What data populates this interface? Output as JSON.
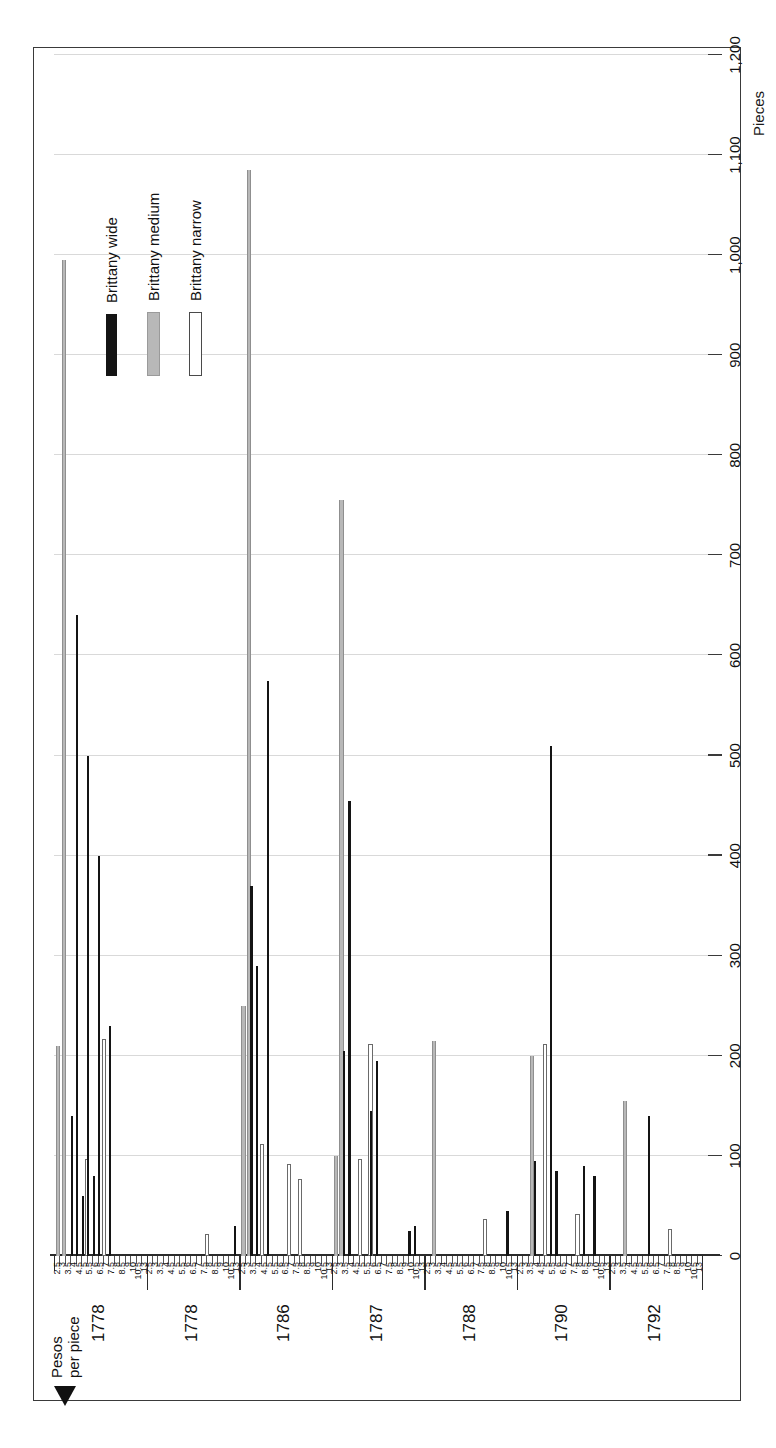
{
  "figure": {
    "border_color": "#3a3a3a",
    "background": "#ffffff",
    "orientation": "rotated-90"
  },
  "axes": {
    "value_axis_title": "Pieces",
    "category_axis_title_line1": "Pesos",
    "category_axis_title_line2": "per piece",
    "value_ticks": [
      "1,200",
      "1,100",
      "1,000",
      "900",
      "800",
      "700",
      "600",
      "500",
      "400",
      "300",
      "200",
      "100",
      "0"
    ],
    "value_min": 0,
    "value_max": 1200,
    "grid": true
  },
  "legend": {
    "position": "top-left",
    "items": [
      {
        "label": "Brittany wide",
        "swatch": "wide",
        "color": "#141414"
      },
      {
        "label": "Brittany medium",
        "swatch": "medium",
        "color": "#b8b8b8"
      },
      {
        "label": "Brittany narrow",
        "swatch": "narrow",
        "color": "#ffffff"
      }
    ]
  },
  "chart_data": {
    "type": "bar",
    "title": "",
    "xlabel": "Pesos per piece",
    "ylabel": "Pieces",
    "ylim": [
      0,
      1200
    ],
    "grid": true,
    "orientation": "vertical-bars-rotated",
    "groups": [
      "1778",
      "1778",
      "1786",
      "1787",
      "1788",
      "1790",
      "1792"
    ],
    "price_ticks": [
      "2.5",
      "3",
      "3.5",
      "4",
      "4.5",
      "5",
      "5.5",
      "6",
      "6.5",
      "7",
      "7.5",
      "8",
      "8.5",
      "9",
      "10",
      "10.5",
      "13"
    ],
    "series": [
      {
        "name": "Brittany wide",
        "color": "#141414"
      },
      {
        "name": "Brittany medium",
        "color": "#b8b8b8"
      },
      {
        "name": "Brittany narrow",
        "color": "#ffffff"
      }
    ],
    "data": [
      {
        "group": "1778",
        "price": "2.5",
        "wide": 0,
        "medium": 210,
        "narrow": 0
      },
      {
        "group": "1778",
        "price": "3",
        "wide": 0,
        "medium": 995,
        "narrow": 0
      },
      {
        "group": "1778",
        "price": "3.5",
        "wide": 0,
        "medium": 0,
        "narrow": 0
      },
      {
        "group": "1778",
        "price": "4",
        "wide": 140,
        "medium": 0,
        "narrow": 0
      },
      {
        "group": "1778",
        "price": "4.5",
        "wide": 640,
        "medium": 0,
        "narrow": 0
      },
      {
        "group": "1778",
        "price": "5",
        "wide": 60,
        "medium": 0,
        "narrow": 95
      },
      {
        "group": "1778",
        "price": "5.5",
        "wide": 500,
        "medium": 0,
        "narrow": 0
      },
      {
        "group": "1778",
        "price": "6",
        "wide": 80,
        "medium": 0,
        "narrow": 0
      },
      {
        "group": "1778",
        "price": "6.5",
        "wide": 400,
        "medium": 0,
        "narrow": 215
      },
      {
        "group": "1778",
        "price": "7",
        "wide": 0,
        "medium": 0,
        "narrow": 0
      },
      {
        "group": "1778",
        "price": "7.5",
        "wide": 230,
        "medium": 0,
        "narrow": 0
      },
      {
        "group": "1778",
        "price": "8",
        "wide": 0,
        "medium": 0,
        "narrow": 0
      },
      {
        "group": "1778",
        "price": "8.5",
        "wide": 0,
        "medium": 0,
        "narrow": 0
      },
      {
        "group": "1778",
        "price": "9",
        "wide": 0,
        "medium": 0,
        "narrow": 0
      },
      {
        "group": "1778",
        "price": "10",
        "wide": 0,
        "medium": 0,
        "narrow": 0
      },
      {
        "group": "1778",
        "price": "10.5",
        "wide": 0,
        "medium": 0,
        "narrow": 0
      },
      {
        "group": "1778",
        "price": "13",
        "wide": 0,
        "medium": 0,
        "narrow": 0
      },
      {
        "group": "1778b",
        "price": "2.5",
        "wide": 0,
        "medium": 0,
        "narrow": 0
      },
      {
        "group": "1778b",
        "price": "3",
        "wide": 0,
        "medium": 0,
        "narrow": 0
      },
      {
        "group": "1778b",
        "price": "3.5",
        "wide": 0,
        "medium": 0,
        "narrow": 0
      },
      {
        "group": "1778b",
        "price": "4",
        "wide": 0,
        "medium": 0,
        "narrow": 0
      },
      {
        "group": "1778b",
        "price": "4.5",
        "wide": 0,
        "medium": 0,
        "narrow": 0
      },
      {
        "group": "1778b",
        "price": "5",
        "wide": 0,
        "medium": 0,
        "narrow": 0
      },
      {
        "group": "1778b",
        "price": "5.5",
        "wide": 0,
        "medium": 0,
        "narrow": 0
      },
      {
        "group": "1778b",
        "price": "6",
        "wide": 0,
        "medium": 0,
        "narrow": 0
      },
      {
        "group": "1778b",
        "price": "6.5",
        "wide": 0,
        "medium": 0,
        "narrow": 0
      },
      {
        "group": "1778b",
        "price": "7",
        "wide": 0,
        "medium": 0,
        "narrow": 0
      },
      {
        "group": "1778b",
        "price": "7.5",
        "wide": 0,
        "medium": 0,
        "narrow": 20
      },
      {
        "group": "1778b",
        "price": "8",
        "wide": 0,
        "medium": 0,
        "narrow": 0
      },
      {
        "group": "1778b",
        "price": "8.5",
        "wide": 0,
        "medium": 0,
        "narrow": 0
      },
      {
        "group": "1778b",
        "price": "9",
        "wide": 0,
        "medium": 0,
        "narrow": 0
      },
      {
        "group": "1778b",
        "price": "10",
        "wide": 0,
        "medium": 0,
        "narrow": 0
      },
      {
        "group": "1778b",
        "price": "10.5",
        "wide": 0,
        "medium": 0,
        "narrow": 0
      },
      {
        "group": "1778b",
        "price": "13",
        "wide": 30,
        "medium": 0,
        "narrow": 0
      },
      {
        "group": "1786",
        "price": "2.5",
        "wide": 0,
        "medium": 250,
        "narrow": 0
      },
      {
        "group": "1786",
        "price": "3",
        "wide": 0,
        "medium": 1085,
        "narrow": 0
      },
      {
        "group": "1786",
        "price": "3.5",
        "wide": 370,
        "medium": 0,
        "narrow": 0
      },
      {
        "group": "1786",
        "price": "4",
        "wide": 290,
        "medium": 0,
        "narrow": 110
      },
      {
        "group": "1786",
        "price": "4.5",
        "wide": 0,
        "medium": 0,
        "narrow": 0
      },
      {
        "group": "1786",
        "price": "5",
        "wide": 575,
        "medium": 0,
        "narrow": 0
      },
      {
        "group": "1786",
        "price": "5.5",
        "wide": 0,
        "medium": 0,
        "narrow": 0
      },
      {
        "group": "1786",
        "price": "6",
        "wide": 0,
        "medium": 0,
        "narrow": 0
      },
      {
        "group": "1786",
        "price": "6.5",
        "wide": 0,
        "medium": 0,
        "narrow": 90
      },
      {
        "group": "1786",
        "price": "7",
        "wide": 0,
        "medium": 0,
        "narrow": 0
      },
      {
        "group": "1786",
        "price": "7.5",
        "wide": 0,
        "medium": 0,
        "narrow": 75
      },
      {
        "group": "1786",
        "price": "8",
        "wide": 0,
        "medium": 0,
        "narrow": 0
      },
      {
        "group": "1786",
        "price": "8.5",
        "wide": 0,
        "medium": 0,
        "narrow": 0
      },
      {
        "group": "1786",
        "price": "9",
        "wide": 0,
        "medium": 0,
        "narrow": 0
      },
      {
        "group": "1786",
        "price": "10",
        "wide": 0,
        "medium": 0,
        "narrow": 0
      },
      {
        "group": "1786",
        "price": "10.5",
        "wide": 0,
        "medium": 0,
        "narrow": 0
      },
      {
        "group": "1786",
        "price": "13",
        "wide": 0,
        "medium": 0,
        "narrow": 0
      },
      {
        "group": "1787",
        "price": "2.5",
        "wide": 0,
        "medium": 100,
        "narrow": 0
      },
      {
        "group": "1787",
        "price": "3",
        "wide": 0,
        "medium": 755,
        "narrow": 0
      },
      {
        "group": "1787",
        "price": "3.5",
        "wide": 205,
        "medium": 0,
        "narrow": 0
      },
      {
        "group": "1787",
        "price": "4",
        "wide": 455,
        "medium": 0,
        "narrow": 0
      },
      {
        "group": "1787",
        "price": "4.5",
        "wide": 0,
        "medium": 0,
        "narrow": 95
      },
      {
        "group": "1787",
        "price": "5",
        "wide": 0,
        "medium": 0,
        "narrow": 0
      },
      {
        "group": "1787",
        "price": "5.5",
        "wide": 0,
        "medium": 0,
        "narrow": 210
      },
      {
        "group": "1787",
        "price": "6",
        "wide": 145,
        "medium": 0,
        "narrow": 0
      },
      {
        "group": "1787",
        "price": "6.5",
        "wide": 195,
        "medium": 0,
        "narrow": 0
      },
      {
        "group": "1787",
        "price": "7",
        "wide": 0,
        "medium": 0,
        "narrow": 0
      },
      {
        "group": "1787",
        "price": "7.5",
        "wide": 0,
        "medium": 0,
        "narrow": 0
      },
      {
        "group": "1787",
        "price": "8",
        "wide": 0,
        "medium": 0,
        "narrow": 0
      },
      {
        "group": "1787",
        "price": "8.5",
        "wide": 0,
        "medium": 0,
        "narrow": 0
      },
      {
        "group": "1787",
        "price": "9",
        "wide": 0,
        "medium": 0,
        "narrow": 0
      },
      {
        "group": "1787",
        "price": "10",
        "wide": 25,
        "medium": 0,
        "narrow": 0
      },
      {
        "group": "1787",
        "price": "10.5",
        "wide": 30,
        "medium": 0,
        "narrow": 0
      },
      {
        "group": "1787",
        "price": "13",
        "wide": 0,
        "medium": 0,
        "narrow": 0
      },
      {
        "group": "1788",
        "price": "2.5",
        "wide": 0,
        "medium": 0,
        "narrow": 0
      },
      {
        "group": "1788",
        "price": "3",
        "wide": 0,
        "medium": 215,
        "narrow": 0
      },
      {
        "group": "1788",
        "price": "3.5",
        "wide": 0,
        "medium": 0,
        "narrow": 0
      },
      {
        "group": "1788",
        "price": "4",
        "wide": 0,
        "medium": 0,
        "narrow": 0
      },
      {
        "group": "1788",
        "price": "4.5",
        "wide": 0,
        "medium": 0,
        "narrow": 0
      },
      {
        "group": "1788",
        "price": "5",
        "wide": 0,
        "medium": 0,
        "narrow": 0
      },
      {
        "group": "1788",
        "price": "5.5",
        "wide": 0,
        "medium": 0,
        "narrow": 0
      },
      {
        "group": "1788",
        "price": "6",
        "wide": 0,
        "medium": 0,
        "narrow": 0
      },
      {
        "group": "1788",
        "price": "6.5",
        "wide": 0,
        "medium": 0,
        "narrow": 0
      },
      {
        "group": "1788",
        "price": "7",
        "wide": 0,
        "medium": 0,
        "narrow": 0
      },
      {
        "group": "1788",
        "price": "7.5",
        "wide": 0,
        "medium": 0,
        "narrow": 35
      },
      {
        "group": "1788",
        "price": "8",
        "wide": 0,
        "medium": 0,
        "narrow": 0
      },
      {
        "group": "1788",
        "price": "8.5",
        "wide": 0,
        "medium": 0,
        "narrow": 0
      },
      {
        "group": "1788",
        "price": "9",
        "wide": 0,
        "medium": 0,
        "narrow": 0
      },
      {
        "group": "1788",
        "price": "10",
        "wide": 0,
        "medium": 0,
        "narrow": 0
      },
      {
        "group": "1788",
        "price": "10.5",
        "wide": 45,
        "medium": 0,
        "narrow": 0
      },
      {
        "group": "1788",
        "price": "13",
        "wide": 0,
        "medium": 0,
        "narrow": 0
      },
      {
        "group": "1790",
        "price": "2.5",
        "wide": 0,
        "medium": 0,
        "narrow": 0
      },
      {
        "group": "1790",
        "price": "3",
        "wide": 0,
        "medium": 0,
        "narrow": 0
      },
      {
        "group": "1790",
        "price": "3.5",
        "wide": 0,
        "medium": 200,
        "narrow": 0
      },
      {
        "group": "1790",
        "price": "4",
        "wide": 95,
        "medium": 0,
        "narrow": 0
      },
      {
        "group": "1790",
        "price": "4.5",
        "wide": 0,
        "medium": 0,
        "narrow": 210
      },
      {
        "group": "1790",
        "price": "5",
        "wide": 0,
        "medium": 0,
        "narrow": 0
      },
      {
        "group": "1790",
        "price": "5.5",
        "wide": 510,
        "medium": 0,
        "narrow": 0
      },
      {
        "group": "1790",
        "price": "6",
        "wide": 85,
        "medium": 0,
        "narrow": 0
      },
      {
        "group": "1790",
        "price": "6.5",
        "wide": 0,
        "medium": 0,
        "narrow": 0
      },
      {
        "group": "1790",
        "price": "7",
        "wide": 0,
        "medium": 0,
        "narrow": 0
      },
      {
        "group": "1790",
        "price": "7.5",
        "wide": 0,
        "medium": 0,
        "narrow": 40
      },
      {
        "group": "1790",
        "price": "8",
        "wide": 0,
        "medium": 0,
        "narrow": 0
      },
      {
        "group": "1790",
        "price": "8.5",
        "wide": 90,
        "medium": 0,
        "narrow": 0
      },
      {
        "group": "1790",
        "price": "9",
        "wide": 0,
        "medium": 0,
        "narrow": 0
      },
      {
        "group": "1790",
        "price": "10",
        "wide": 80,
        "medium": 0,
        "narrow": 0
      },
      {
        "group": "1790",
        "price": "10.5",
        "wide": 0,
        "medium": 0,
        "narrow": 0
      },
      {
        "group": "1790",
        "price": "13",
        "wide": 0,
        "medium": 0,
        "narrow": 0
      },
      {
        "group": "1792",
        "price": "2.5",
        "wide": 0,
        "medium": 0,
        "narrow": 0
      },
      {
        "group": "1792",
        "price": "3",
        "wide": 0,
        "medium": 0,
        "narrow": 0
      },
      {
        "group": "1792",
        "price": "3.5",
        "wide": 0,
        "medium": 155,
        "narrow": 0
      },
      {
        "group": "1792",
        "price": "4",
        "wide": 0,
        "medium": 0,
        "narrow": 0
      },
      {
        "group": "1792",
        "price": "4.5",
        "wide": 0,
        "medium": 0,
        "narrow": 0
      },
      {
        "group": "1792",
        "price": "5",
        "wide": 0,
        "medium": 0,
        "narrow": 0
      },
      {
        "group": "1792",
        "price": "5.5",
        "wide": 0,
        "medium": 0,
        "narrow": 0
      },
      {
        "group": "1792",
        "price": "6",
        "wide": 140,
        "medium": 0,
        "narrow": 0
      },
      {
        "group": "1792",
        "price": "6.5",
        "wide": 0,
        "medium": 0,
        "narrow": 0
      },
      {
        "group": "1792",
        "price": "7",
        "wide": 0,
        "medium": 0,
        "narrow": 0
      },
      {
        "group": "1792",
        "price": "7.5",
        "wide": 0,
        "medium": 0,
        "narrow": 25
      },
      {
        "group": "1792",
        "price": "8",
        "wide": 0,
        "medium": 0,
        "narrow": 0
      },
      {
        "group": "1792",
        "price": "8.5",
        "wide": 0,
        "medium": 0,
        "narrow": 0
      },
      {
        "group": "1792",
        "price": "9",
        "wide": 0,
        "medium": 0,
        "narrow": 0
      },
      {
        "group": "1792",
        "price": "10",
        "wide": 0,
        "medium": 0,
        "narrow": 0
      },
      {
        "group": "1792",
        "price": "10.5",
        "wide": 0,
        "medium": 0,
        "narrow": 0
      },
      {
        "group": "1792",
        "price": "13",
        "wide": 0,
        "medium": 0,
        "narrow": 0
      }
    ],
    "group_labels": [
      {
        "label": "1778",
        "index": 0
      },
      {
        "label": "1778",
        "index": 1
      },
      {
        "label": "1786",
        "index": 2
      },
      {
        "label": "1787",
        "index": 3
      },
      {
        "label": "1788",
        "index": 4
      },
      {
        "label": "1790",
        "index": 5
      },
      {
        "label": "1792",
        "index": 6
      }
    ]
  }
}
